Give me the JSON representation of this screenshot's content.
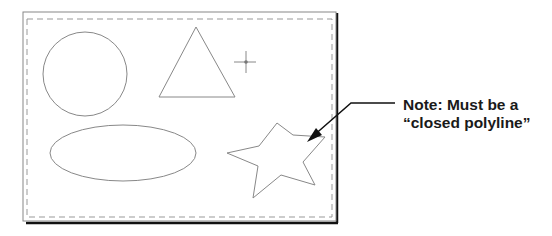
{
  "note": {
    "line1": "Note: Must be a",
    "line2": "“closed polyline”"
  },
  "shapes": [
    "circle",
    "triangle",
    "crosshair",
    "ellipse",
    "star"
  ],
  "colors": {
    "shape_stroke": "#888888",
    "frame": "#222222",
    "dashed_border": "#999999",
    "leader": "#111111"
  }
}
